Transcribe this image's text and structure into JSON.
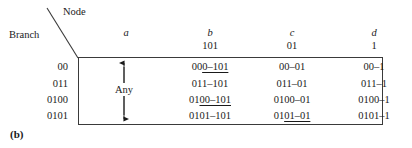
{
  "figure": {
    "caption": "(b)",
    "corner": {
      "node_label": "Node",
      "branch_label": "Branch"
    }
  },
  "table": {
    "columns": [
      {
        "name": "a",
        "code": ""
      },
      {
        "name": "b",
        "code": "101"
      },
      {
        "name": "c",
        "code": "01"
      },
      {
        "name": "d",
        "code": "1"
      }
    ],
    "row_labels": [
      "00",
      "011",
      "0100",
      "0101"
    ],
    "column_a": {
      "annotation": "Any"
    },
    "rows": [
      {
        "label": "00",
        "b": {
          "plain": "00",
          "underlined": "0–101",
          "tail": ""
        },
        "c": {
          "plain": "00–01",
          "underlined": "",
          "tail": ""
        },
        "d": {
          "plain": "00–1",
          "underlined": "",
          "tail": ""
        }
      },
      {
        "label": "011",
        "b": {
          "plain": "011–101",
          "underlined": "",
          "tail": ""
        },
        "c": {
          "plain": "011–01",
          "underlined": "",
          "tail": ""
        },
        "d": {
          "plain": "011–1",
          "underlined": "",
          "tail": ""
        }
      },
      {
        "label": "0100",
        "b": {
          "plain": "01",
          "underlined": "00–101",
          "tail": ""
        },
        "c": {
          "plain": "0100–01",
          "underlined": "",
          "tail": ""
        },
        "d": {
          "plain": "0100–1",
          "underlined": "",
          "tail": ""
        }
      },
      {
        "label": "0101",
        "b": {
          "plain": "0101–101",
          "underlined": "",
          "tail": ""
        },
        "c": {
          "plain": "01",
          "underlined": "01–01",
          "tail": ""
        },
        "d": {
          "plain": "0101–1",
          "underlined": "",
          "tail": ""
        }
      }
    ]
  },
  "colors": {
    "ink": "#1a1a1a",
    "rule": "#3a3a3a"
  }
}
